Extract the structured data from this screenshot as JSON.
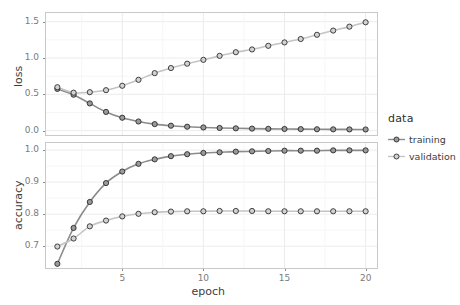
{
  "chart_data": {
    "type": "line",
    "title": "",
    "xlabel": "epoch",
    "facets": [
      {
        "name": "loss",
        "ylabel": "loss",
        "ylim": [
          -0.06,
          1.62
        ],
        "yticks": [
          0.0,
          0.5,
          1.0,
          1.5
        ],
        "yticklabels": [
          "0.0",
          "0.5",
          "1.0",
          "1.5"
        ]
      },
      {
        "name": "accuracy",
        "ylabel": "accuracy",
        "ylim": [
          0.632,
          1.022
        ],
        "yticks": [
          0.7,
          0.8,
          0.9,
          1.0
        ],
        "yticklabels": [
          "0.7",
          "0.8",
          "0.9",
          "1.0"
        ]
      }
    ],
    "xlim": [
      0.3,
      20.7
    ],
    "xticks": [
      5,
      10,
      15,
      20
    ],
    "xticklabels": [
      "5",
      "10",
      "15",
      "20"
    ],
    "x": [
      1,
      2,
      3,
      4,
      5,
      6,
      7,
      8,
      9,
      10,
      11,
      12,
      13,
      14,
      15,
      16,
      17,
      18,
      19,
      20
    ],
    "grid": true,
    "legend": {
      "title": "data",
      "position": "right",
      "entries": [
        {
          "label": "training",
          "color": "#8c8c8c"
        },
        {
          "label": "validation",
          "color": "#c4c4c4"
        }
      ]
    },
    "series": [
      {
        "facet": "loss",
        "name": "training",
        "color": "#8c8c8c",
        "values": [
          0.575,
          0.495,
          0.375,
          0.258,
          0.178,
          0.126,
          0.09,
          0.068,
          0.054,
          0.044,
          0.037,
          0.032,
          0.028,
          0.025,
          0.023,
          0.021,
          0.019,
          0.018,
          0.017,
          0.016
        ]
      },
      {
        "facet": "loss",
        "name": "validation",
        "color": "#c4c4c4",
        "values": [
          0.598,
          0.523,
          0.53,
          0.557,
          0.618,
          0.7,
          0.792,
          0.862,
          0.922,
          0.975,
          1.03,
          1.08,
          1.118,
          1.168,
          1.215,
          1.262,
          1.32,
          1.378,
          1.432,
          1.492
        ]
      },
      {
        "facet": "accuracy",
        "name": "training",
        "color": "#8c8c8c",
        "values": [
          0.645,
          0.757,
          0.838,
          0.897,
          0.933,
          0.957,
          0.971,
          0.981,
          0.987,
          0.991,
          0.993,
          0.995,
          0.996,
          0.997,
          0.998,
          0.998,
          0.998,
          0.999,
          0.999,
          0.999
        ]
      },
      {
        "facet": "accuracy",
        "name": "validation",
        "color": "#c4c4c4",
        "values": [
          0.699,
          0.724,
          0.762,
          0.78,
          0.793,
          0.801,
          0.806,
          0.808,
          0.809,
          0.809,
          0.81,
          0.81,
          0.81,
          0.809,
          0.809,
          0.809,
          0.809,
          0.809,
          0.809,
          0.809
        ]
      }
    ],
    "style": {
      "point_fill": "#9a9a9a",
      "point_stroke": "#1a1a1a",
      "grid_major": "#ececec",
      "grid_minor": "#f6f6f6",
      "panel_border": "#c9c9c9",
      "background": "#ffffff"
    }
  }
}
